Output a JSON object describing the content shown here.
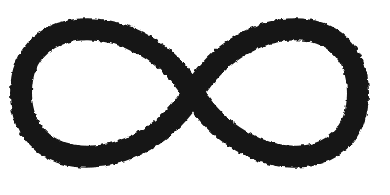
{
  "canvas": {
    "background_color": "#ffffff"
  },
  "symbol": {
    "name": "infinity",
    "glyph": "∞",
    "color": "#161616"
  }
}
